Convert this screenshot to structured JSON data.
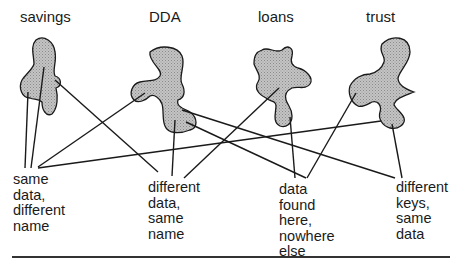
{
  "diagram": {
    "systems": [
      {
        "id": "savings",
        "label": "savings"
      },
      {
        "id": "dda",
        "label": "DDA"
      },
      {
        "id": "loans",
        "label": "loans"
      },
      {
        "id": "trust",
        "label": "trust"
      }
    ],
    "annotations": [
      {
        "id": "same-data-different-name",
        "text": "same\ndata,\ndifferent\nname"
      },
      {
        "id": "different-data-same-name",
        "text": "different\ndata,\nsame\nname"
      },
      {
        "id": "data-found-here-nowhere-else",
        "text": "data\nfound\nhere,\nnowhere\nelse"
      },
      {
        "id": "different-keys-same-data",
        "text": "different\nkeys,\nsame\ndata"
      }
    ],
    "connections": [
      {
        "from": "savings",
        "to": "same-data-different-name"
      },
      {
        "from": "savings",
        "to": "same-data-different-name"
      },
      {
        "from": "savings",
        "to": "different-data-same-name"
      },
      {
        "from": "dda",
        "to": "same-data-different-name"
      },
      {
        "from": "dda",
        "to": "different-data-same-name"
      },
      {
        "from": "dda",
        "to": "data-found-here-nowhere-else"
      },
      {
        "from": "dda",
        "to": "different-keys-same-data"
      },
      {
        "from": "loans",
        "to": "different-data-same-name"
      },
      {
        "from": "loans",
        "to": "data-found-here-nowhere-else"
      },
      {
        "from": "trust",
        "to": "same-data-different-name"
      },
      {
        "from": "trust",
        "to": "data-found-here-nowhere-else"
      },
      {
        "from": "trust",
        "to": "different-keys-same-data"
      }
    ],
    "colors": {
      "blob_fill": "#b8b8b8",
      "stroke": "#1a1a1a",
      "rule": "#333333"
    }
  }
}
